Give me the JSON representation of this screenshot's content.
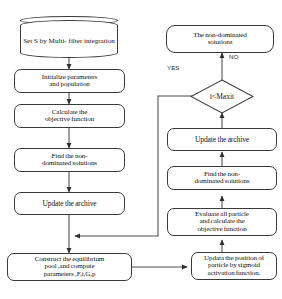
{
  "diagram": {
    "colors": {
      "stroke": "#3a3a3a",
      "text": "#111111",
      "background": "#ffffff",
      "label_text": "#2b2b2b"
    },
    "nodes": {
      "data_source": {
        "shape": "cylinder",
        "line1": "Set S by Multi-",
        "line2": "filter integration"
      },
      "initialize": {
        "shape": "process",
        "line1": "Initialize parameters",
        "line2": "and population"
      },
      "calculate_objective_left": {
        "shape": "process",
        "line1": "Calculate the",
        "line2": "objective function"
      },
      "find_nondominated_left": {
        "shape": "process",
        "line1": "Find the non-",
        "line2": "dominated soiutions"
      },
      "update_archive_left": {
        "shape": "process",
        "line1": "Update the archive"
      },
      "equilibrium_pool": {
        "shape": "process",
        "line1": "Construct the equilibrium",
        "line2": "pool ,and compute",
        "line3": "parameters ,F,t,G,p"
      },
      "update_position": {
        "shape": "process",
        "line1": "Updata the position of",
        "line2": "particle by sigmoid",
        "line3": "activation function."
      },
      "evaluate_particles": {
        "shape": "process",
        "line1": "Evaluate all particle",
        "line2": "and calculate the",
        "line3": "objective function"
      },
      "find_nondominated_right": {
        "shape": "process",
        "line1": "Find the non-",
        "line2": "dominated soiutions"
      },
      "update_archive_right": {
        "shape": "process",
        "line1": "Update the archive"
      },
      "decision": {
        "shape": "diamond",
        "label": "t<Maxit"
      },
      "output": {
        "shape": "terminator",
        "line1": "The non-dominated",
        "line2": "soiutions"
      }
    },
    "edge_labels": {
      "yes": "YES",
      "no": "NO"
    }
  }
}
